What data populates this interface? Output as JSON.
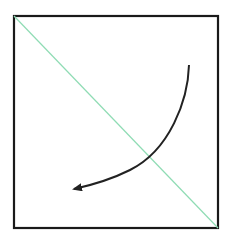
{
  "diagram": {
    "square": {
      "x": 14,
      "y": 16,
      "width": 204,
      "height": 212,
      "stroke": "#1a1a1a"
    },
    "diagonal": {
      "from": [
        14,
        16
      ],
      "to": [
        218,
        228
      ],
      "color": "#8fdcb4"
    },
    "arrow": {
      "start": [
        189,
        65
      ],
      "end": [
        68,
        190
      ],
      "color": "#222222",
      "direction": "counter-clockwise toward bottom-left"
    }
  }
}
